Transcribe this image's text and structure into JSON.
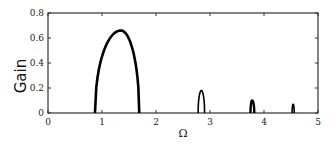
{
  "chart_data": {
    "type": "line",
    "title": "",
    "xlabel": "Ω",
    "ylabel": "Gain",
    "xlim": [
      0,
      5
    ],
    "ylim": [
      0,
      0.8
    ],
    "xticks": [
      "0",
      "1",
      "2",
      "3",
      "4",
      "5"
    ],
    "yticks": [
      "0",
      "0.2",
      "0.4",
      "0.6",
      "0.8"
    ],
    "grid": false,
    "legend": null,
    "series": [
      {
        "name": "lobe1",
        "x": [
          0.87,
          1.0,
          1.15,
          1.35,
          1.55,
          1.69
        ],
        "y": [
          0.0,
          0.42,
          0.6,
          0.66,
          0.52,
          0.0
        ]
      },
      {
        "name": "lobe2",
        "x": [
          2.78,
          2.84,
          2.9
        ],
        "y": [
          0.0,
          0.18,
          0.0
        ]
      },
      {
        "name": "lobe3",
        "x": [
          3.75,
          3.78,
          3.82
        ],
        "y": [
          0.0,
          0.1,
          0.0
        ]
      },
      {
        "name": "lobe4",
        "x": [
          4.52,
          4.54,
          4.56
        ],
        "y": [
          0.0,
          0.07,
          0.0
        ]
      }
    ]
  }
}
